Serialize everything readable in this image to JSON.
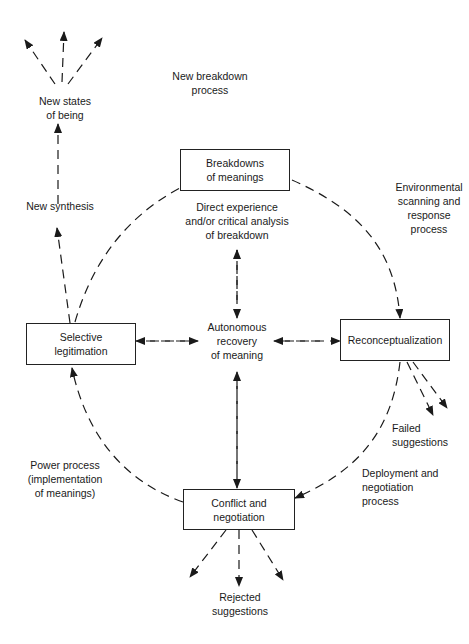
{
  "diagram": {
    "boxes": {
      "breakdowns": [
        "Breakdowns",
        "of meanings"
      ],
      "selective": [
        "Selective",
        "legitimation"
      ],
      "reconceptualization": [
        "Reconceptualization"
      ],
      "conflict": [
        "Conflict and",
        "negotiation"
      ]
    },
    "labels": {
      "new_states": [
        "New states",
        "of being"
      ],
      "new_breakdown": [
        "New breakdown",
        "process"
      ],
      "new_synthesis": [
        "New synthesis"
      ],
      "direct_experience": [
        "Direct experience",
        "and/or critical analysis",
        "of breakdown"
      ],
      "environmental": [
        "Environmental",
        "scanning and",
        "response",
        "process"
      ],
      "autonomous": [
        "Autonomous",
        "recovery",
        "of meaning"
      ],
      "failed": [
        "Failed",
        "suggestions"
      ],
      "power": [
        "Power process",
        "(implementation",
        "of meanings)"
      ],
      "deployment": [
        "Deployment and",
        "negotiation",
        "process"
      ],
      "rejected": [
        "Rejected",
        "suggestions"
      ]
    },
    "colors": {
      "ink": "#1a1a1a",
      "background": "#ffffff"
    }
  }
}
